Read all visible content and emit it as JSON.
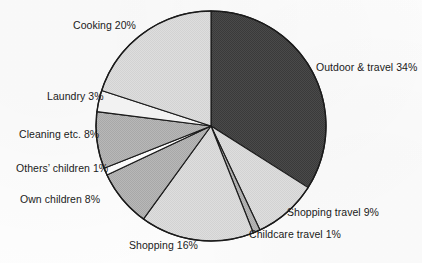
{
  "chart_data": {
    "type": "pie",
    "title": "",
    "subtitle": "",
    "xlabel": "",
    "ylabel": "",
    "units": "percent",
    "total": 100,
    "legend_position": "none",
    "labels_position": "outside",
    "grid": false,
    "start_angle_deg": 0,
    "direction": "clockwise",
    "categories": [
      "Outdoor & travel",
      "Shopping travel",
      "Childcare travel",
      "Shopping",
      "Own children",
      "Others’ children",
      "Cleaning etc.",
      "Laundry",
      "Cooking"
    ],
    "values": [
      34,
      9,
      1,
      16,
      8,
      1,
      8,
      3,
      20
    ],
    "slices": [
      {
        "name": "outdoor-travel",
        "label": "Outdoor & travel 34%",
        "category": "Outdoor & travel",
        "value": 34,
        "color": "#4a4a4a"
      },
      {
        "name": "shopping-travel",
        "label": "Shopping travel 9%",
        "category": "Shopping travel",
        "value": 9,
        "color": "#e3e3e3"
      },
      {
        "name": "childcare-travel",
        "label": "Childcare travel 1%",
        "category": "Childcare travel",
        "value": 1,
        "color": "#9d9d9d"
      },
      {
        "name": "shopping",
        "label": "Shopping 16%",
        "category": "Shopping",
        "value": 16,
        "color": "#d9d9d9"
      },
      {
        "name": "own-children",
        "label": "Own children 8%",
        "category": "Own children",
        "value": 8,
        "color": "#b4b4b4"
      },
      {
        "name": "others-children",
        "label": "Others’ children 1%",
        "category": "Others’ children",
        "value": 1,
        "color": "#fbfbfb"
      },
      {
        "name": "cleaning",
        "label": "Cleaning etc. 8%",
        "category": "Cleaning etc.",
        "value": 8,
        "color": "#b4b4b4"
      },
      {
        "name": "laundry",
        "label": "Laundry 3%",
        "category": "Laundry",
        "value": 3,
        "color": "#f2f2f2"
      },
      {
        "name": "cooking",
        "label": "Cooking 20%",
        "category": "Cooking",
        "value": 20,
        "color": "#cfcfcf"
      }
    ],
    "geometry": {
      "center_x": 211,
      "center_y": 126,
      "radius": 115
    },
    "style": {
      "background": "#fdfdfd",
      "outline": "#1b1b1b",
      "text": "#1a1a1a"
    }
  }
}
